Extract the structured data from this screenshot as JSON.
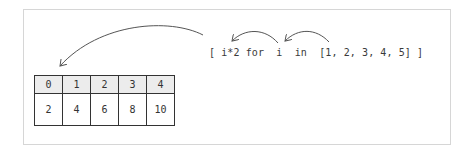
{
  "diagram": {
    "code": "[ i*2 for  i  in  [1, 2, 3, 4, 5] ]",
    "arrows": [
      {
        "name": "list-to-i",
        "from": "[1, 2, 3, 4, 5]",
        "to": "i"
      },
      {
        "name": "i-to-expression",
        "from": "i",
        "to": "i*2"
      },
      {
        "name": "comprehension-to-result",
        "from": "[",
        "to": "result-array"
      }
    ],
    "result_array": {
      "indices": [
        "0",
        "1",
        "2",
        "3",
        "4"
      ],
      "values": [
        "2",
        "4",
        "6",
        "8",
        "10"
      ]
    },
    "colors": {
      "stroke": "#333333",
      "arrow": "#555555",
      "header_fill": "#ececec",
      "frame": "#d6d6d6"
    }
  }
}
